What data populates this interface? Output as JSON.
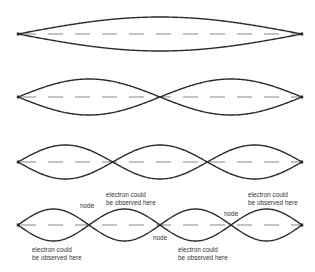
{
  "colors": {
    "wave": "#2a2a2a",
    "axis": "#555555",
    "text": "#333333",
    "background": "#ffffff"
  },
  "geometry": {
    "x_start": 18,
    "x_end": 302
  },
  "waves": [
    {
      "name": "standing-wave-n1",
      "loops": 1,
      "center_y": 34,
      "amplitude": 17
    },
    {
      "name": "standing-wave-n2",
      "loops": 2,
      "center_y": 97,
      "amplitude": 18
    },
    {
      "name": "standing-wave-n3",
      "loops": 3,
      "center_y": 162,
      "amplitude": 17
    },
    {
      "name": "standing-wave-n4",
      "loops": 4,
      "center_y": 225,
      "amplitude": 16
    }
  ],
  "labels": {
    "electron_top_1": {
      "line1": "electron could",
      "line2": "be observed here"
    },
    "electron_top_2": {
      "line1": "electron could",
      "line2": "be observed here"
    },
    "electron_bottom_1": {
      "line1": "electron could",
      "line2": "be observed here"
    },
    "electron_bottom_2": {
      "line1": "electron could",
      "line2": "be observed here"
    },
    "node_1": "node",
    "node_2": "node",
    "node_3": "node"
  }
}
